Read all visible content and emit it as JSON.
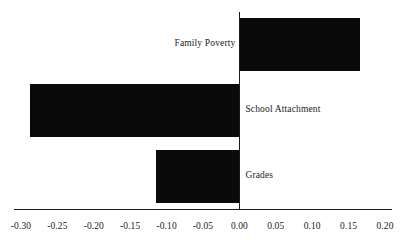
{
  "chart_data": {
    "type": "bar",
    "orientation": "horizontal",
    "title": "",
    "subtitle": "",
    "xlabel": "",
    "ylabel": "",
    "categories": [
      "Family Poverty",
      "School Attachment",
      "Grades"
    ],
    "values": [
      0.166,
      -0.288,
      -0.114
    ],
    "series": [
      {
        "name": "Effect",
        "values": [
          0.166,
          -0.288,
          -0.114
        ]
      }
    ],
    "xlim": [
      -0.3,
      0.2
    ],
    "ylim": [
      0,
      3
    ],
    "xticks": [
      -0.3,
      -0.25,
      -0.2,
      -0.15,
      -0.1,
      -0.05,
      0.0,
      0.05,
      0.1,
      0.15,
      0.2
    ],
    "xtick_labels": [
      "-0.30",
      "-0.25",
      "-0.20",
      "-0.15",
      "-0.10",
      "-0.05",
      "0.00",
      "0.05",
      "0.10",
      "0.15",
      "0.20"
    ],
    "grid": false,
    "legend": false,
    "legend_position": "none",
    "bar_color": "#0a0a0a",
    "axis_color": "#1a1a1a",
    "background_color": "#ffffff",
    "annotations": [],
    "zero_reference_line": 0.0
  },
  "axis": {
    "zero_line_name": "zero-reference-line",
    "baseline_name": "x-axis-baseline"
  }
}
